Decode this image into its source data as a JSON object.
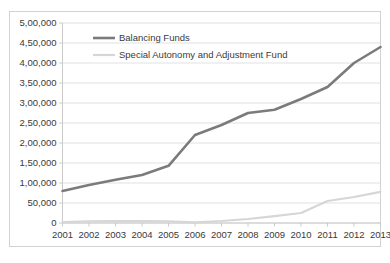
{
  "chart_data": {
    "type": "line",
    "title": "",
    "xlabel": "",
    "ylabel": "",
    "grid": true,
    "legend_position": "top-center-inside",
    "x": [
      2001,
      2002,
      2003,
      2004,
      2005,
      2006,
      2007,
      2008,
      2009,
      2010,
      2011,
      2012,
      2013
    ],
    "categories": [
      "2001",
      "2002",
      "2003",
      "2004",
      "2005",
      "2006",
      "2007",
      "2008",
      "2009",
      "2010",
      "2011",
      "2012",
      "2013"
    ],
    "xtick_labels": [
      "2001",
      "2002",
      "2003",
      "2004",
      "2005",
      "2006",
      "2007",
      "2008",
      "2009",
      "2010",
      "2011",
      "2012",
      "2013"
    ],
    "ylim": [
      0,
      500000
    ],
    "ytick_values": [
      0,
      50000,
      100000,
      150000,
      200000,
      250000,
      300000,
      350000,
      400000,
      450000,
      500000
    ],
    "ytick_labels": [
      "0",
      "50,000",
      "1,00,000",
      "1,50,000",
      "2,00,000",
      "2,50,000",
      "3,00,000",
      "3,50,000",
      "4,00,000",
      "4,50,000",
      "5,00,000"
    ],
    "series": [
      {
        "name": "Balancing Funds",
        "color": "#7b7b7b",
        "stroke_width": 2.6,
        "values": [
          80000,
          95000,
          108000,
          120000,
          143000,
          220000,
          245000,
          275000,
          283000,
          310000,
          340000,
          400000,
          440000
        ]
      },
      {
        "name": "Special Autonomy and Adjustment Fund",
        "color": "#d6d6d6",
        "stroke_width": 2.2,
        "values": [
          2000,
          4000,
          5000,
          4500,
          4000,
          1500,
          5000,
          10000,
          17000,
          25000,
          55000,
          65000,
          78000
        ]
      }
    ]
  },
  "legend": {
    "items": [
      {
        "label": "Balancing Funds",
        "color": "#7b7b7b"
      },
      {
        "label": "Special Autonomy and Adjustment Fund",
        "color": "#d6d6d6"
      }
    ]
  },
  "axes": {
    "y_labels": [
      "5,00,000",
      "4,50,000",
      "4,00,000",
      "3,50,000",
      "3,00,000",
      "2,50,000",
      "2,00,000",
      "1,50,000",
      "1,00,000",
      "50,000",
      "0"
    ],
    "x_labels": [
      "2001",
      "2002",
      "2003",
      "2004",
      "2005",
      "2006",
      "2007",
      "2008",
      "2009",
      "2010",
      "2011",
      "2012",
      "2013"
    ]
  },
  "colors": {
    "series_dark": "#7b7b7b",
    "series_light": "#d6d6d6",
    "gridline": "#d9d9d9",
    "border": "#d2d2d2",
    "text": "#3a3a3a",
    "background": "#ffffff"
  }
}
